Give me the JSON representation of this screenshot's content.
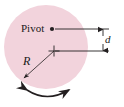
{
  "figure": {
    "name": "pivot-disk-physical-pendulum-diagram",
    "canvas": {
      "width": 124,
      "height": 107,
      "background": "#ffffff"
    },
    "disk": {
      "name": "disk",
      "fill": "#f2d3dc",
      "center_x": 46,
      "center_y": 47,
      "radius": 42
    },
    "labels": {
      "pivot": "Pivot",
      "distance": "d",
      "radius": "R"
    },
    "markers": {
      "pivot_point": {
        "x": 52,
        "y": 29,
        "style": "filled-dot"
      },
      "center_of_mass": {
        "x": 54,
        "y": 51,
        "style": "plus-cross"
      }
    },
    "leader_lines": {
      "upper_y": 29,
      "lower_y": 51,
      "right_x": 109
    },
    "dimension_line": {
      "x": 103,
      "top_y": 28,
      "bottom_y": 52,
      "arrowheads": "both"
    },
    "radius_arrow": {
      "from_x": 54,
      "from_y": 51,
      "to_x": 23,
      "to_y": 79,
      "arrowhead": "end"
    },
    "swing_arc": {
      "description": "double-headed curved arrow below disk indicating oscillation",
      "arrowheads": "both"
    },
    "line_color": "#231f20"
  }
}
